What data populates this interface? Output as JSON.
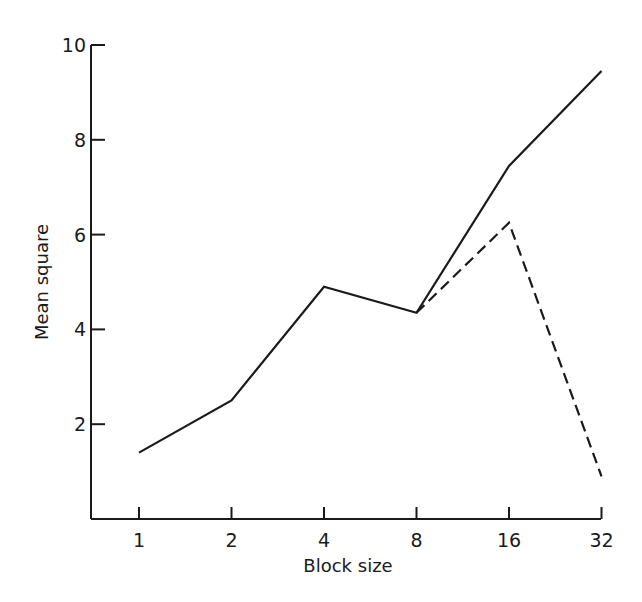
{
  "chart_data": {
    "type": "line",
    "title": "",
    "xlabel": "Block size",
    "ylabel": "Mean square",
    "x_scale": "log2",
    "categories": [
      "1",
      "2",
      "4",
      "8",
      "16",
      "32"
    ],
    "x": [
      1,
      2,
      4,
      8,
      16,
      32
    ],
    "ylim": [
      0,
      10
    ],
    "yticks": [
      2,
      4,
      6,
      8,
      10
    ],
    "ytick_labels": [
      "2",
      "4",
      "6",
      "8",
      "10"
    ],
    "grid": false,
    "legend": null,
    "series": [
      {
        "name": "solid",
        "style": "solid",
        "color": "#1a1a1a",
        "values": [
          1.4,
          2.5,
          4.9,
          4.35,
          7.45,
          9.45
        ]
      },
      {
        "name": "dashed",
        "style": "dashed",
        "color": "#1a1a1a",
        "x": [
          8,
          16,
          32
        ],
        "values": [
          4.35,
          6.25,
          0.9
        ]
      }
    ]
  }
}
